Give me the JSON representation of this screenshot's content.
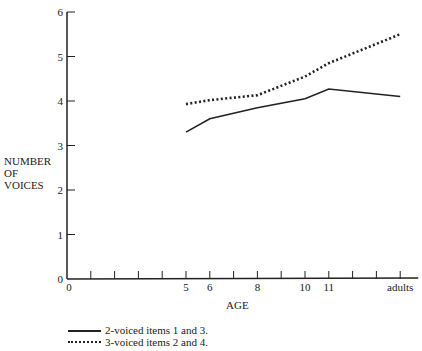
{
  "chart_data": {
    "type": "line",
    "title": "",
    "xlabel": "AGE",
    "ylabel": "NUMBER OF VOICES",
    "ylim": [
      0,
      6
    ],
    "yticks": [
      "0",
      "1",
      "2",
      "3",
      "4",
      "5",
      "6"
    ],
    "xtick_labels": [
      "0",
      "5",
      "6",
      "8",
      "10",
      "11",
      "adults"
    ],
    "x_positions": [
      "5",
      "6",
      "8",
      "10",
      "11",
      "adults"
    ],
    "grid": false,
    "legend_position": "bottom-left",
    "series": [
      {
        "name": "2-voiced items 1 and 3.",
        "style": "solid",
        "values": [
          3.3,
          3.6,
          3.85,
          4.05,
          4.27,
          4.1
        ]
      },
      {
        "name": "3-voiced items 2 and 4.",
        "style": "dotted",
        "values": [
          3.93,
          4.02,
          4.13,
          4.55,
          4.85,
          5.5
        ]
      }
    ]
  },
  "labels": {
    "ylabel_lines": [
      "NUMBER",
      "OF",
      "VOICES"
    ],
    "xlabel": "AGE"
  },
  "legend": [
    {
      "label": "2-voiced items 1 and 3."
    },
    {
      "label": "3-voiced items 2 and 4."
    }
  ]
}
